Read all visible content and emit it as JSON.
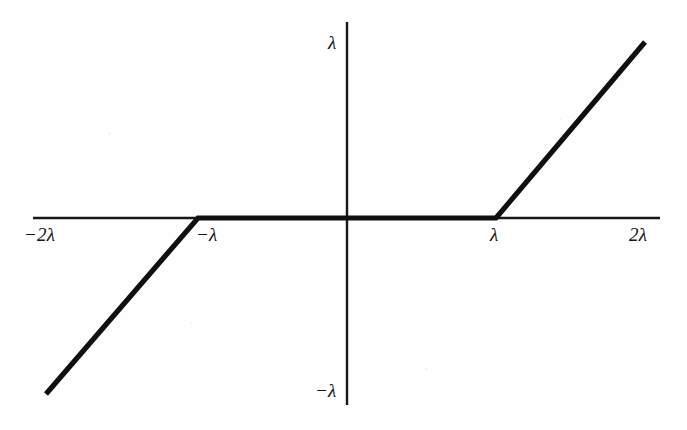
{
  "figure": {
    "width": 687,
    "height": 430,
    "background_color": "#fefefe",
    "ink_color": "#131313",
    "caption": ""
  },
  "axes": {
    "origin": {
      "x": 347,
      "y": 218
    },
    "x_axis": {
      "start_px": 33,
      "end_px": 660,
      "y_px": 218
    },
    "y_axis": {
      "start_px": 22,
      "end_px": 405,
      "x_px": 347
    },
    "x_unit_px": 149,
    "y_unit_px": 176,
    "grid": false,
    "legend": "none"
  },
  "labels": {
    "x_neg2lambda": "−2λ",
    "x_neglambda": "−λ",
    "x_lambda": "λ",
    "x_2lambda": "2λ",
    "y_lambda": "λ",
    "y_neglambda": "−λ"
  },
  "chart_data": {
    "type": "line",
    "title": "",
    "subtitle": "",
    "xlabel": "",
    "ylabel": "",
    "grid": false,
    "legend_position": "none",
    "xlim": [
      -2.11,
      2.1
    ],
    "ylim": [
      -1.11,
      1.11
    ],
    "xticks": [
      -2,
      -1,
      1,
      2
    ],
    "xticklabels": [
      "−2λ",
      "−λ",
      "λ",
      "2λ"
    ],
    "yticks": [
      -1,
      1
    ],
    "yticklabels": [
      "−λ",
      "λ"
    ],
    "series": [
      {
        "name": "soft-threshold",
        "x": [
          -2.02,
          -1.0,
          1.0,
          2.0
        ],
        "y": [
          -1.0,
          0.0,
          0.0,
          1.0
        ],
        "color": "#101010",
        "linewidth_px": 5.2
      }
    ],
    "annotations": []
  }
}
